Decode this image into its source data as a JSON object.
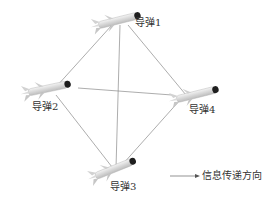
{
  "diagram": {
    "nodes": [
      {
        "id": "m1",
        "label": "导弹1",
        "missile_x": 120,
        "missile_y": 22,
        "label_x": 137,
        "label_y": 22
      },
      {
        "id": "m2",
        "label": "导弹2",
        "missile_x": 50,
        "missile_y": 88,
        "label_x": 33,
        "label_y": 101
      },
      {
        "id": "m4",
        "label": "导弹4",
        "missile_x": 190,
        "missile_y": 96,
        "label_x": 190,
        "label_y": 104
      },
      {
        "id": "m3",
        "label": "导弹3",
        "missile_x": 116,
        "missile_y": 170,
        "label_x": 110,
        "label_y": 181
      }
    ],
    "edges": [
      {
        "from": "m1",
        "to": "m2",
        "x1": 112,
        "y1": 25,
        "x2": 56,
        "y2": 87
      },
      {
        "from": "m1",
        "to": "m3",
        "x1": 120,
        "y1": 25,
        "x2": 116,
        "y2": 168
      },
      {
        "from": "m1",
        "to": "m4",
        "x1": 128,
        "y1": 25,
        "x2": 186,
        "y2": 95
      },
      {
        "from": "m2",
        "to": "m4",
        "x1": 78,
        "y1": 88,
        "x2": 172,
        "y2": 95
      },
      {
        "from": "m2",
        "to": "m3",
        "x1": 56,
        "y1": 95,
        "x2": 112,
        "y2": 167
      },
      {
        "from": "m4",
        "to": "m3",
        "x1": 180,
        "y1": 100,
        "x2": 122,
        "y2": 165
      }
    ],
    "legend": {
      "arrow_icon": "arrow-right-icon",
      "label": "信息传递方向"
    },
    "colors": {
      "line": "#8a8a8a",
      "missile_body": "#e6e6e6",
      "missile_tip": "#222222",
      "text": "#333333"
    }
  }
}
